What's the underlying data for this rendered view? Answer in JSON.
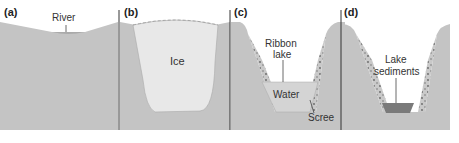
{
  "figure": {
    "panels": [
      {
        "id": "a",
        "label": "(a)",
        "annotations": [
          "River"
        ]
      },
      {
        "id": "b",
        "label": "(b)",
        "annotations": [
          "Ice"
        ]
      },
      {
        "id": "c",
        "label": "(c)",
        "annotations": [
          "Ribbon lake",
          "Water",
          "Scree"
        ]
      },
      {
        "id": "d",
        "label": "(d)",
        "annotations": [
          "Lake sediments"
        ]
      }
    ]
  },
  "labels": {
    "a": "(a)",
    "b": "(b)",
    "c": "(c)",
    "d": "(d)",
    "river": "River",
    "ice": "Ice",
    "ribbon_lake_1": "Ribbon",
    "ribbon_lake_2": "lake",
    "water": "Water",
    "scree": "Scree",
    "lake_sediments_1": "Lake",
    "lake_sediments_2": "sediments"
  },
  "colors": {
    "rock": "#c4c4c4",
    "ice": "#e8e8e8",
    "water": "#cfcfcf",
    "sediment": "#7a7a7a",
    "divider": "#333333"
  }
}
